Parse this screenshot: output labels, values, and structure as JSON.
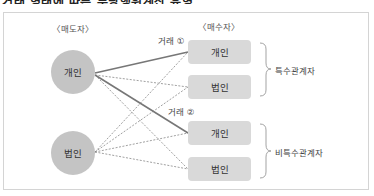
{
  "title": "거래 형태에 따른 부당행위계산 유형",
  "headers": {
    "seller": "〈매도자〉",
    "buyer": "〈매수자〉"
  },
  "sellers": [
    {
      "label": "개인",
      "cx": 73,
      "cy": 72
    },
    {
      "label": "법인",
      "cx": 73,
      "cy": 153
    }
  ],
  "buyers": [
    {
      "label": "개인",
      "group": "특수관계자",
      "x": 188,
      "y": 40
    },
    {
      "label": "법인",
      "group": "특수관계자",
      "x": 188,
      "y": 75
    },
    {
      "label": "개인",
      "group": "비특수관계자",
      "x": 188,
      "y": 121
    },
    {
      "label": "법인",
      "group": "비특수관계자",
      "x": 188,
      "y": 157
    }
  ],
  "trades": [
    {
      "label": "거래 ①",
      "from_seller": 0,
      "to_buyer": 0,
      "style": "solid"
    },
    {
      "label": "거래 ②",
      "from_seller": 0,
      "to_buyer": 2,
      "style": "solid"
    }
  ],
  "other_links_style": "dashed",
  "groups": [
    {
      "label": "특수관계자",
      "buyers": [
        0,
        1
      ]
    },
    {
      "label": "비특수관계자",
      "buyers": [
        2,
        3
      ]
    }
  ],
  "colors": {
    "circle_fill": "#c4c4c4",
    "box_fill": "#d9d9d9",
    "solid_line": "#777777",
    "dashed_line": "#888888",
    "frame_border": "#d4d4d4"
  }
}
